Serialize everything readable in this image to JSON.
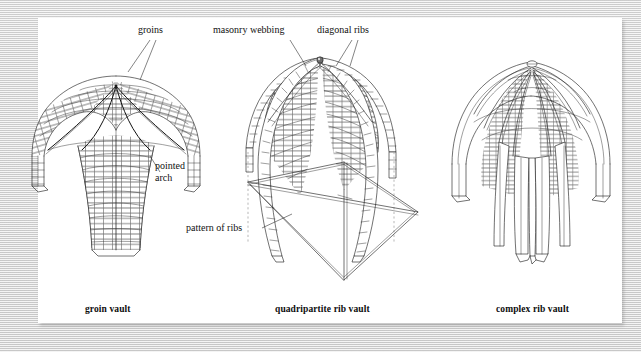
{
  "figure": {
    "kind": "architectural-illustration",
    "background_color": "#ffffff",
    "frame_color": "#d8d8d8",
    "ink_color": "#1a1a1a"
  },
  "annotations": {
    "groins": "groins",
    "pointed_arch_line1": "pointed",
    "pointed_arch_line2": "arch",
    "masonry_webbing": "masonry webbing",
    "diagonal_ribs": "diagonal ribs",
    "pattern_of_ribs": "pattern of ribs"
  },
  "captions": {
    "left": "groin vault",
    "middle": "quadripartite rib vault",
    "right": "complex rib vault"
  },
  "panels": [
    {
      "id": "groin-vault",
      "caption": "groin vault",
      "labels": [
        "groins",
        "pointed arch"
      ],
      "features": [
        "continuous masonry webbing",
        "sharp groin edges",
        "pointed arch profile"
      ]
    },
    {
      "id": "quadripartite-rib-vault",
      "caption": "quadripartite rib vault",
      "labels": [
        "masonry webbing",
        "diagonal ribs",
        "pattern of ribs"
      ],
      "features": [
        "four webbing cells",
        "two crossing diagonal ribs",
        "boss at crown",
        "rib plan shown below"
      ]
    },
    {
      "id": "complex-rib-vault",
      "caption": "complex rib vault",
      "labels": [],
      "features": [
        "multiple tierceron ribs",
        "fan of ribs at crown",
        "clustered springing"
      ]
    }
  ]
}
